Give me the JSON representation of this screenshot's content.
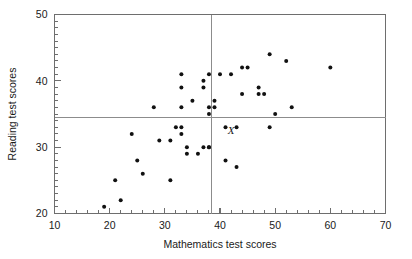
{
  "chart_data": {
    "type": "scatter",
    "title": "",
    "xlabel": "Mathematics test scores",
    "ylabel": "Reading test scores",
    "xlim": [
      10,
      70
    ],
    "ylim": [
      20,
      50
    ],
    "x_major_ticks": [
      10,
      20,
      30,
      40,
      50,
      60,
      70
    ],
    "y_major_ticks": [
      20,
      30,
      40,
      50
    ],
    "x_tick_labels": [
      "10",
      "20",
      "30",
      "40",
      "50",
      "60",
      "70"
    ],
    "y_tick_labels": [
      "20",
      "30",
      "40",
      "50"
    ],
    "x_minor_step": 2,
    "y_minor_step": 1,
    "grid": false,
    "legend": false,
    "reference_lines": [
      {
        "orientation": "vertical",
        "value": 38.5,
        "label": "mean mathematics score"
      },
      {
        "orientation": "horizontal",
        "value": 34.5,
        "label": "mean reading score"
      }
    ],
    "annotations": [
      {
        "text": "X",
        "x": 42.0,
        "y": 32.0,
        "style": "italic"
      }
    ],
    "points": [
      [
        19,
        21
      ],
      [
        21,
        25
      ],
      [
        22,
        22
      ],
      [
        24,
        32
      ],
      [
        25,
        28
      ],
      [
        26,
        26
      ],
      [
        28,
        36
      ],
      [
        29,
        31
      ],
      [
        31,
        25
      ],
      [
        31,
        31
      ],
      [
        32,
        33
      ],
      [
        33,
        33
      ],
      [
        33,
        32
      ],
      [
        33,
        41
      ],
      [
        33,
        39
      ],
      [
        33,
        36
      ],
      [
        34,
        29
      ],
      [
        34,
        30
      ],
      [
        35,
        37
      ],
      [
        36,
        29
      ],
      [
        37,
        30
      ],
      [
        37,
        39
      ],
      [
        37,
        40
      ],
      [
        38,
        30
      ],
      [
        38,
        41
      ],
      [
        38,
        36
      ],
      [
        38,
        35
      ],
      [
        38,
        30
      ],
      [
        39,
        36
      ],
      [
        39,
        37
      ],
      [
        40,
        41
      ],
      [
        41,
        33
      ],
      [
        41,
        28
      ],
      [
        42,
        41
      ],
      [
        43,
        33
      ],
      [
        43,
        27
      ],
      [
        44,
        42
      ],
      [
        44,
        38
      ],
      [
        45,
        42
      ],
      [
        47,
        39
      ],
      [
        47,
        38
      ],
      [
        48,
        38
      ],
      [
        49,
        44
      ],
      [
        49,
        33
      ],
      [
        50,
        35
      ],
      [
        52,
        43
      ],
      [
        53,
        36
      ],
      [
        60,
        42
      ]
    ]
  },
  "axes": {
    "x_title": "Mathematics test scores",
    "y_title": "Reading test scores"
  }
}
